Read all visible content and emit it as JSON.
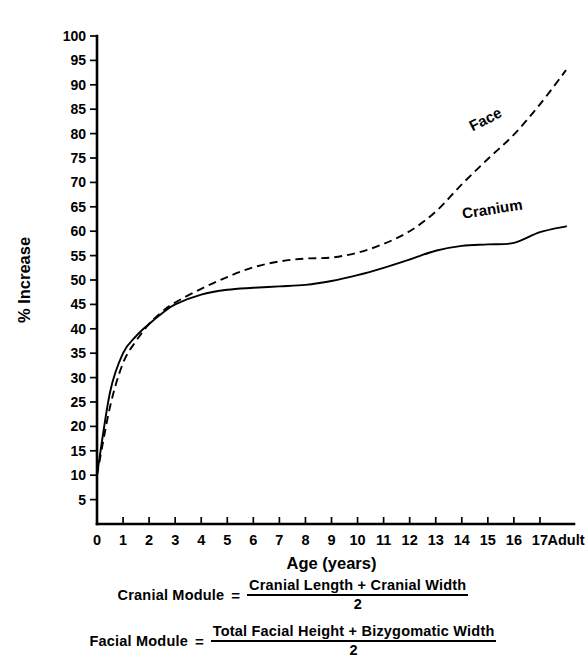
{
  "chart_data": {
    "type": "line",
    "title": "",
    "xlabel": "Age (years)",
    "ylabel": "% Increase",
    "xlim": [
      0,
      18
    ],
    "ylim": [
      0,
      100
    ],
    "grid": false,
    "legend_position": "inline-curve-labels",
    "x_tick_labels": [
      "0",
      "1",
      "2",
      "3",
      "4",
      "5",
      "6",
      "7",
      "8",
      "9",
      "10",
      "11",
      "12",
      "13",
      "14",
      "15",
      "16",
      "17",
      "Adult"
    ],
    "y_tick_labels": [
      "0",
      "5",
      "10",
      "15",
      "20",
      "25",
      "30",
      "35",
      "40",
      "45",
      "50",
      "55",
      "60",
      "65",
      "70",
      "75",
      "80",
      "85",
      "90",
      "95",
      "100"
    ],
    "x": [
      0,
      0.5,
      1,
      1.5,
      2,
      2.5,
      3,
      4,
      5,
      6,
      7,
      8,
      9,
      10,
      11,
      12,
      13,
      14,
      15,
      16,
      17,
      18
    ],
    "series": [
      {
        "name": "Cranium",
        "style": "solid",
        "values": [
          10,
          27,
          35,
          38.5,
          41,
          43.2,
          45,
          47,
          48,
          48.4,
          48.7,
          49,
          49.8,
          51,
          52.5,
          54.2,
          56,
          57,
          57.3,
          57.6,
          59.8,
          61
        ]
      },
      {
        "name": "Face",
        "style": "dashed",
        "values": [
          10,
          24,
          33,
          37.5,
          41,
          43.5,
          45.4,
          48.2,
          50.6,
          52.6,
          53.8,
          54.4,
          54.6,
          55.6,
          57.4,
          60,
          64,
          69.6,
          74.8,
          79.8,
          86,
          93
        ]
      }
    ],
    "series_label_positions": [
      {
        "name": "Face",
        "x": 15.0,
        "y": 82,
        "rotate": -27
      },
      {
        "name": "Cranium",
        "x": 15.2,
        "y": 63.5,
        "rotate": -9
      }
    ]
  },
  "formulas": [
    {
      "lhs": "Cranial Module",
      "equals": "=",
      "numerator": "Cranial Length + Cranial Width",
      "denominator": "2"
    },
    {
      "lhs": "Facial Module",
      "equals": "=",
      "numerator": "Total Facial Height + Bizygomatic Width",
      "denominator": "2"
    }
  ],
  "colors": {
    "ink": "#000000",
    "background": "#ffffff"
  }
}
